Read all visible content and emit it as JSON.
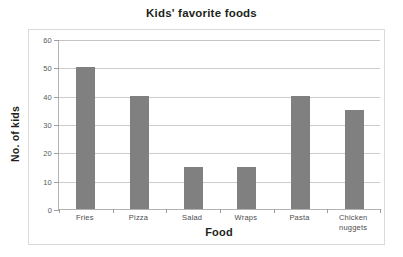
{
  "chart_data": {
    "type": "bar",
    "title": "Kids' favorite foods",
    "xlabel": "Food",
    "ylabel": "No. of kids",
    "categories": [
      "Fries",
      "Pizza",
      "Salad",
      "Wraps",
      "Pasta",
      "Chicken nuggets"
    ],
    "category_lines": [
      [
        "Fries"
      ],
      [
        "Pizza"
      ],
      [
        "Salad"
      ],
      [
        "Wraps"
      ],
      [
        "Pasta"
      ],
      [
        "Chicken",
        "nuggets"
      ]
    ],
    "values": [
      50,
      40,
      15,
      15,
      40,
      35
    ],
    "ylim": [
      0,
      60
    ],
    "yticks": [
      0,
      10,
      20,
      30,
      40,
      50,
      60
    ],
    "ytick_labels": [
      "0",
      "10",
      "20",
      "30",
      "40",
      "50",
      "60"
    ],
    "grid": true,
    "grid_axis": "y",
    "legend": false,
    "bar_color": "#808080",
    "grid_color": "#cccccc",
    "axis_color": "#b3b3b3",
    "frame_color": "#d9d9d9",
    "background": "#ffffff"
  }
}
